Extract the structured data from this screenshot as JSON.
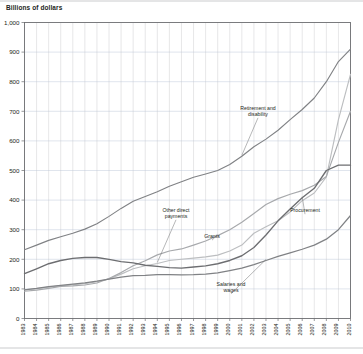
{
  "figure": {
    "title": "Billions of dollars",
    "background_color": "#ffffff",
    "frame_color": "#6d6e71"
  },
  "chart_data": {
    "type": "line",
    "title": "Billions of dollars",
    "xlabel": "",
    "ylabel": "Billions of dollars",
    "ylim": [
      0,
      1000
    ],
    "ytick_values": [
      0,
      100,
      200,
      300,
      400,
      500,
      600,
      700,
      800,
      900,
      1000
    ],
    "ytick_labels": [
      "0",
      "100",
      "200",
      "300",
      "400",
      "500",
      "600",
      "700",
      "800",
      "900",
      "1,000"
    ],
    "grid": true,
    "grid_axis": "both",
    "legend_position": "inline-annotations",
    "x": [
      1983,
      1984,
      1985,
      1986,
      1987,
      1988,
      1989,
      1990,
      1991,
      1992,
      1993,
      1994,
      1995,
      1996,
      1997,
      1998,
      1999,
      2000,
      2001,
      2002,
      2003,
      2004,
      2005,
      2006,
      2007,
      2008,
      2009,
      2010
    ],
    "xtick_labels": [
      "1983",
      "1984",
      "1985",
      "1986",
      "1987",
      "1988",
      "1989",
      "1990",
      "1991",
      "1992",
      "1993",
      "1994",
      "1995",
      "1996",
      "1997",
      "1998",
      "1999",
      "2000",
      "2001",
      "2002",
      "2003",
      "2004",
      "2005",
      "2006",
      "2007",
      "2008",
      "2009",
      "2010"
    ],
    "series": [
      {
        "name": "Retirement and disability",
        "color": "#808285",
        "width": 1.15,
        "values": [
          232,
          248,
          264,
          276,
          288,
          302,
          320,
          345,
          372,
          396,
          412,
          428,
          447,
          462,
          477,
          488,
          500,
          520,
          548,
          580,
          606,
          636,
          672,
          706,
          745,
          800,
          868,
          910
        ]
      },
      {
        "name": "Other direct payments",
        "color": "#bcbec0",
        "width": 1.15,
        "values": [
          97,
          101,
          106,
          110,
          114,
          118,
          124,
          134,
          150,
          168,
          178,
          186,
          196,
          200,
          204,
          208,
          214,
          228,
          248,
          288,
          310,
          330,
          360,
          398,
          424,
          478,
          672,
          825
        ]
      },
      {
        "name": "Grants",
        "color": "#a7a9ac",
        "width": 1.15,
        "values": [
          92,
          96,
          102,
          108,
          110,
          113,
          120,
          135,
          155,
          178,
          195,
          215,
          228,
          235,
          248,
          262,
          280,
          300,
          325,
          355,
          385,
          405,
          420,
          432,
          450,
          480,
          595,
          700
        ]
      },
      {
        "name": "Procurement",
        "color": "#6d6e71",
        "width": 1.35,
        "values": [
          152,
          168,
          185,
          196,
          203,
          206,
          206,
          200,
          192,
          188,
          180,
          176,
          172,
          170,
          174,
          178,
          185,
          196,
          212,
          240,
          282,
          330,
          370,
          408,
          440,
          500,
          518,
          518
        ]
      },
      {
        "name": "Salaries and wages",
        "color": "#808285",
        "width": 1.25,
        "values": [
          97,
          102,
          108,
          112,
          116,
          120,
          126,
          133,
          140,
          145,
          146,
          148,
          148,
          147,
          148,
          150,
          154,
          162,
          170,
          182,
          196,
          210,
          222,
          234,
          248,
          268,
          300,
          348
        ]
      }
    ],
    "annotations": [
      {
        "label": "Retirement and disability",
        "series": "Retirement and disability"
      },
      {
        "label": "Other direct payments",
        "series": "Other direct payments"
      },
      {
        "label": "Grants",
        "series": "Grants"
      },
      {
        "label": "Procurement",
        "series": "Procurement"
      },
      {
        "label": "Salaries and wages",
        "series": "Salaries and wages"
      }
    ]
  }
}
